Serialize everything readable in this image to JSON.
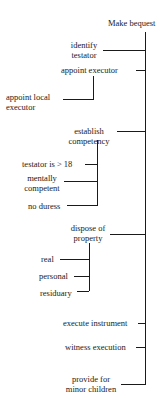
{
  "diagram": {
    "root": "Make bequest",
    "nodes": {
      "identify_testator": "identify testator",
      "identify_line1": "identify",
      "identify_line2": "testator",
      "appoint_executor": "appoint executor",
      "appoint_local_executor_1": "appoint local",
      "appoint_local_executor_2": "executor",
      "establish_competency_1": "establish",
      "establish_competency_2": "competency",
      "testator_over_18": "testator is > 18",
      "mentally_competent_1": "mentally",
      "mentally_competent_2": "competent",
      "no_duress": "no duress",
      "dispose_property_1": "dispose of",
      "dispose_property_2": "property",
      "real": "real",
      "personal": "personal",
      "residuary": "residuary",
      "execute_instrument": "execute instrument",
      "witness_execution": "witness execution",
      "provide_minor_1": "provide for",
      "provide_minor_2": "minor children"
    },
    "tree": {
      "label": "Make bequest",
      "children": [
        {
          "label": "identify testator"
        },
        {
          "label": "appoint executor",
          "children": [
            {
              "label": "appoint local executor"
            }
          ]
        },
        {
          "label": "establish competency",
          "children": [
            {
              "label": "testator is > 18"
            },
            {
              "label": "mentally competent"
            },
            {
              "label": "no duress"
            }
          ]
        },
        {
          "label": "dispose of property",
          "children": [
            {
              "label": "real"
            },
            {
              "label": "personal"
            },
            {
              "label": "residuary"
            }
          ]
        },
        {
          "label": "execute instrument"
        },
        {
          "label": "witness execution"
        },
        {
          "label": "provide for minor children"
        }
      ]
    }
  }
}
